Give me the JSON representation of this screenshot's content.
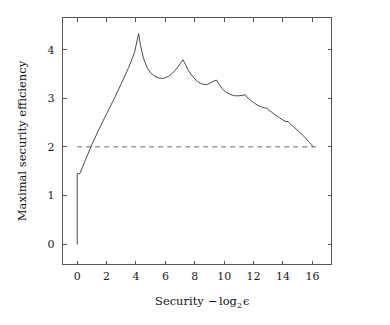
{
  "chart_data": {
    "type": "line",
    "title": "",
    "xlabel": "Security − log₂ ε",
    "xlabel_parts": {
      "lead": "Security",
      "minus": "−",
      "log": "log",
      "base": "2",
      "epsilon": "ϵ"
    },
    "ylabel": "Maximal security efficiency",
    "xlim": [
      -1.0,
      17.3
    ],
    "ylim": [
      -0.42,
      4.66
    ],
    "xticks": [
      0,
      2,
      4,
      6,
      8,
      10,
      12,
      14,
      16
    ],
    "xticklabels": [
      "0",
      "2",
      "4",
      "6",
      "8",
      "10",
      "12",
      "14",
      "16"
    ],
    "yticks": [
      0,
      1,
      2,
      3,
      4
    ],
    "yticklabels": [
      "0",
      "1",
      "2",
      "3",
      "4"
    ],
    "grid": false,
    "legend": null,
    "frame": "box",
    "tick_direction": "in",
    "series": [
      {
        "name": "Maximal security efficiency",
        "style": "solid",
        "color": "#4a4a4a",
        "x": [
          0.0,
          0.0,
          0.18,
          0.55,
          1.0,
          1.5,
          2.0,
          2.5,
          3.0,
          3.5,
          3.9,
          4.18,
          4.3,
          4.5,
          4.75,
          5.0,
          5.3,
          5.6,
          5.9,
          6.2,
          6.5,
          6.8,
          7.05,
          7.2,
          7.35,
          7.6,
          7.9,
          8.2,
          8.5,
          8.8,
          9.1,
          9.35,
          9.5,
          9.62,
          9.85,
          10.1,
          10.4,
          10.7,
          11.0,
          11.25,
          11.42,
          11.55,
          11.8,
          12.05,
          12.3,
          12.55,
          12.75,
          12.9,
          13.0,
          13.25,
          13.5,
          13.75,
          14.0,
          14.2,
          14.35,
          14.45,
          14.7,
          14.95,
          15.2,
          15.4,
          15.55,
          15.65,
          15.8,
          15.95,
          16.05
        ],
        "y": [
          0.0,
          1.45,
          1.45,
          1.72,
          2.05,
          2.37,
          2.68,
          2.98,
          3.3,
          3.63,
          3.94,
          4.33,
          4.1,
          3.83,
          3.63,
          3.52,
          3.45,
          3.41,
          3.41,
          3.45,
          3.52,
          3.62,
          3.73,
          3.79,
          3.7,
          3.55,
          3.43,
          3.34,
          3.29,
          3.28,
          3.32,
          3.36,
          3.37,
          3.3,
          3.2,
          3.13,
          3.08,
          3.05,
          3.05,
          3.06,
          3.07,
          3.02,
          2.96,
          2.9,
          2.85,
          2.82,
          2.8,
          2.8,
          2.76,
          2.71,
          2.65,
          2.6,
          2.55,
          2.52,
          2.52,
          2.48,
          2.42,
          2.35,
          2.28,
          2.22,
          2.18,
          2.14,
          2.09,
          2.04,
          2.0
        ]
      },
      {
        "name": "threshold",
        "style": "dashed",
        "color": "#6b6b6b",
        "constant_y": 2.0,
        "x_range": [
          0.0,
          16.25
        ]
      }
    ]
  },
  "figure": {
    "background_color": "#ffffff",
    "axis_color": "#555555",
    "curve_color": "#4a4a4a",
    "dash_color": "#6b6b6b"
  }
}
